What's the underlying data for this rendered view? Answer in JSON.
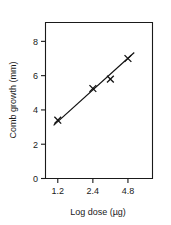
{
  "chart_data": {
    "type": "scatter",
    "title": "",
    "xlabel": "Log dose (µg)",
    "ylabel": "Comb growth (mm)",
    "x_tick_labels": [
      "1.2",
      "2.4",
      "4.8"
    ],
    "x_tick_positions": [
      1.2,
      2.4,
      4.8
    ],
    "y_tick_labels": [
      "0",
      "2",
      "4",
      "6",
      "8"
    ],
    "y_tick_values": [
      0,
      2,
      4,
      6,
      8
    ],
    "ylim": [
      0,
      9
    ],
    "grid": false,
    "legend": null,
    "marker_style": "x",
    "points": [
      {
        "x_label": "1.2",
        "x_index": 0.0,
        "y": 3.4
      },
      {
        "x_label": "2.4",
        "x_index": 1.0,
        "y": 5.25
      },
      {
        "x_label": "3.4",
        "x_index": 1.5,
        "y": 5.8
      },
      {
        "x_label": "4.8",
        "x_index": 2.0,
        "y": 7.0
      }
    ],
    "fit_line": {
      "type": "linear-regression",
      "start": {
        "x_index": -0.12,
        "y": 3.1
      },
      "end": {
        "x_index": 2.18,
        "y": 7.35
      }
    },
    "axis_ranges": {
      "x_index_min": -0.35,
      "x_index_max": 2.7,
      "y_min": 0,
      "y_max": 9.1
    }
  },
  "figure": {
    "caption": "",
    "background_color": "#ffffff",
    "ink_color": "#1a1a1a"
  }
}
